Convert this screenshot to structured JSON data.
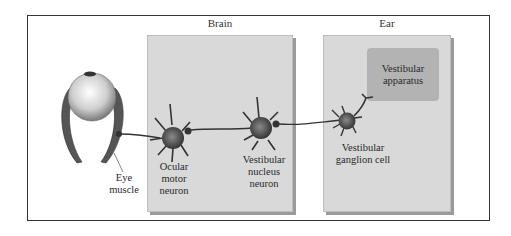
{
  "diagram": {
    "regions": [
      {
        "id": "brain",
        "title": "Brain"
      },
      {
        "id": "ear",
        "title": "Ear"
      }
    ],
    "structures": {
      "eye_muscle": "Eye muscle",
      "ocular_motor_neuron": [
        "Ocular",
        "motor",
        "neuron"
      ],
      "vestibular_nucleus_neuron": [
        "Vestibular",
        "nucleus",
        "neuron"
      ],
      "vestibular_ganglion_cell": [
        "Vestibular",
        "ganglion cell"
      ],
      "vestibular_apparatus": [
        "Vestibular",
        "apparatus"
      ]
    },
    "eye_muscle_lines": [
      "Eye",
      "muscle"
    ],
    "colors": {
      "panel": "#d9d9d9",
      "panel_shadow": "#9a9a9a",
      "apparatus": "#b3b3b3",
      "neuron": "#555555",
      "axon": "#333333"
    },
    "pathway": [
      "Vestibular apparatus",
      "Vestibular ganglion cell",
      "Vestibular nucleus neuron",
      "Ocular motor neuron",
      "Eye muscle"
    ]
  }
}
